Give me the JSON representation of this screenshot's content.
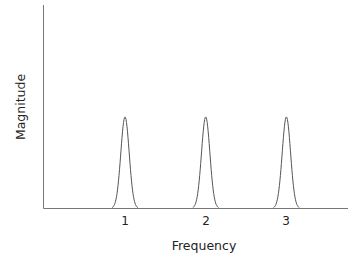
{
  "chart_data": {
    "type": "line",
    "title": "",
    "xlabel": "Frequency",
    "ylabel": "Magnitude",
    "x_ticks": [
      "1",
      "2",
      "3"
    ],
    "series": [
      {
        "name": "spectrum",
        "description": "Three identical narrow Gaussian-shaped peaks centered at frequencies 1, 2 and 3",
        "peaks": [
          {
            "x": 1,
            "height": 0.45
          },
          {
            "x": 2,
            "height": 0.45
          },
          {
            "x": 3,
            "height": 0.45
          }
        ]
      }
    ],
    "xlim": [
      0,
      3.7
    ],
    "ylim": [
      0,
      1
    ],
    "grid": false,
    "legend": null,
    "y_ticks": []
  },
  "layout": {
    "line_color": "#555555",
    "axis_color": "#777777"
  }
}
